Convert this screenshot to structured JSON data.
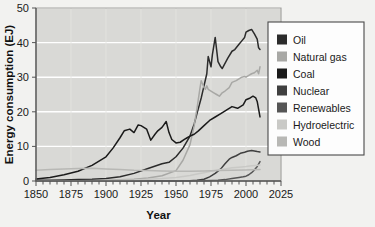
{
  "chart_data": {
    "type": "line",
    "title": "",
    "xlabel": "Year",
    "ylabel": "Energy consumption (EJ)",
    "xlim": [
      1850,
      2025
    ],
    "ylim": [
      0,
      50
    ],
    "xticks": [
      1850,
      1875,
      1900,
      1925,
      1950,
      1975,
      2000,
      2025
    ],
    "yticks": [
      0,
      10,
      20,
      30,
      40,
      50
    ],
    "xtick_labels": [
      "1850",
      "1875",
      "1900",
      "1925",
      "1950",
      "1975",
      "2000",
      "2025"
    ],
    "ytick_labels": [
      "0",
      "10",
      "20",
      "30",
      "40",
      "50"
    ],
    "minor_xtick_step": 5,
    "grid": "horizontal-white",
    "legend_position": "right",
    "plot_background": "#d9d9d6",
    "figure_background": "#f2f2f0",
    "series": [
      {
        "name": "Oil",
        "color": "#2b2b2b",
        "x": [
          1850,
          1860,
          1870,
          1880,
          1890,
          1900,
          1910,
          1920,
          1930,
          1940,
          1945,
          1950,
          1955,
          1960,
          1963,
          1966,
          1968,
          1970,
          1972,
          1973,
          1974,
          1975,
          1976,
          1978,
          1979,
          1980,
          1982,
          1983,
          1985,
          1987,
          1990,
          1992,
          1995,
          1997,
          1999,
          2000,
          2002,
          2004,
          2006,
          2008,
          2009,
          2010
        ],
        "y": [
          0.2,
          0.2,
          0.3,
          0.4,
          0.5,
          0.7,
          1.2,
          2.2,
          3.6,
          5.0,
          5.4,
          7.0,
          9.5,
          13.0,
          16.5,
          21.0,
          24.0,
          27.5,
          31.0,
          36.0,
          34.5,
          33.0,
          36.5,
          41.5,
          38.0,
          34.5,
          33.0,
          32.5,
          34.0,
          35.5,
          37.5,
          38.0,
          39.5,
          40.5,
          41.5,
          43.0,
          43.5,
          43.8,
          42.5,
          41.0,
          38.5,
          38.0
        ]
      },
      {
        "name": "Natural gas",
        "color": "#a8a8a5",
        "x": [
          1850,
          1880,
          1900,
          1920,
          1930,
          1940,
          1950,
          1955,
          1960,
          1963,
          1965,
          1967,
          1968,
          1970,
          1971,
          1972,
          1973,
          1975,
          1977,
          1979,
          1981,
          1983,
          1985,
          1988,
          1990,
          1993,
          1995,
          1997,
          1999,
          2000,
          2002,
          2004,
          2006,
          2008,
          2009,
          2010
        ],
        "y": [
          0.0,
          0.1,
          0.2,
          0.5,
          0.9,
          1.5,
          3.0,
          6.0,
          10.5,
          16.0,
          21.0,
          26.5,
          29.0,
          27.0,
          26.5,
          27.5,
          26.5,
          26.0,
          25.5,
          25.0,
          24.5,
          25.5,
          26.0,
          27.0,
          28.5,
          29.0,
          29.5,
          30.0,
          30.2,
          30.0,
          30.5,
          31.0,
          31.3,
          32.0,
          31.0,
          33.0
        ]
      },
      {
        "name": "Coal",
        "color": "#1a1a1a",
        "x": [
          1850,
          1860,
          1870,
          1880,
          1890,
          1900,
          1905,
          1910,
          1913,
          1917,
          1920,
          1923,
          1925,
          1929,
          1932,
          1935,
          1937,
          1940,
          1943,
          1945,
          1947,
          1950,
          1953,
          1956,
          1958,
          1960,
          1963,
          1966,
          1970,
          1974,
          1978,
          1982,
          1986,
          1990,
          1994,
          1998,
          2000,
          2003,
          2005,
          2007,
          2008,
          2010
        ],
        "y": [
          0.6,
          1.0,
          1.8,
          2.8,
          4.5,
          7.0,
          9.5,
          12.5,
          14.5,
          15.0,
          14.0,
          16.2,
          16.0,
          15.0,
          11.8,
          13.5,
          14.5,
          15.5,
          17.2,
          14.0,
          12.0,
          11.0,
          11.2,
          12.0,
          12.5,
          13.0,
          13.5,
          14.5,
          16.0,
          17.5,
          18.5,
          19.5,
          20.5,
          21.5,
          21.0,
          22.0,
          23.5,
          24.0,
          24.5,
          24.0,
          23.0,
          18.5
        ]
      },
      {
        "name": "Nuclear",
        "color": "#3f3f3f",
        "x": [
          1850,
          1955,
          1960,
          1965,
          1970,
          1974,
          1978,
          1982,
          1985,
          1988,
          1990,
          1993,
          1996,
          1999,
          2001,
          2004,
          2006,
          2008,
          2010
        ],
        "y": [
          0.0,
          0.0,
          0.05,
          0.2,
          0.5,
          1.2,
          2.2,
          3.5,
          5.0,
          6.3,
          6.8,
          7.3,
          8.0,
          8.3,
          8.6,
          8.8,
          8.7,
          8.5,
          8.4
        ]
      },
      {
        "name": "Renewables",
        "color": "#555555",
        "x": [
          1850,
          1960,
          1970,
          1980,
          1985,
          1990,
          1995,
          1998,
          2000,
          2002,
          2004,
          2006,
          2008,
          2009,
          2010
        ],
        "y": [
          0.0,
          0.0,
          0.05,
          0.2,
          0.4,
          0.7,
          1.0,
          1.2,
          1.4,
          1.8,
          2.4,
          3.2,
          4.2,
          4.9,
          5.6
        ]
      },
      {
        "name": "Hydroelectric",
        "color": "#c9c9c6",
        "x": [
          1850,
          1900,
          1920,
          1930,
          1940,
          1950,
          1955,
          1960,
          1965,
          1970,
          1975,
          1980,
          1985,
          1990,
          1995,
          2000,
          2004,
          2007,
          2010
        ],
        "y": [
          0.0,
          0.1,
          0.3,
          0.5,
          0.7,
          1.0,
          1.3,
          1.6,
          2.0,
          2.4,
          2.8,
          3.2,
          3.5,
          3.8,
          4.0,
          4.2,
          4.4,
          4.5,
          4.6
        ]
      },
      {
        "name": "Wood",
        "color": "#b8b8b5",
        "x": [
          1850,
          1860,
          1870,
          1880,
          1890,
          1900,
          1910,
          1920,
          1930,
          1940,
          1950,
          1960,
          1970,
          1980,
          1990,
          2000,
          2010
        ],
        "y": [
          3.1,
          3.3,
          3.5,
          3.6,
          3.7,
          3.5,
          3.3,
          3.1,
          3.0,
          2.9,
          2.8,
          2.8,
          2.9,
          3.0,
          3.1,
          3.2,
          3.3
        ]
      }
    ],
    "legend_entries": [
      {
        "label": "Oil",
        "color": "#2b2b2b"
      },
      {
        "label": "Natural gas",
        "color": "#a8a8a5"
      },
      {
        "label": "Coal",
        "color": "#1a1a1a"
      },
      {
        "label": "Nuclear",
        "color": "#3f3f3f"
      },
      {
        "label": "Renewables",
        "color": "#555555"
      },
      {
        "label": "Hydroelectric",
        "color": "#c9c9c6"
      },
      {
        "label": "Wood",
        "color": "#b8b8b5"
      }
    ]
  }
}
